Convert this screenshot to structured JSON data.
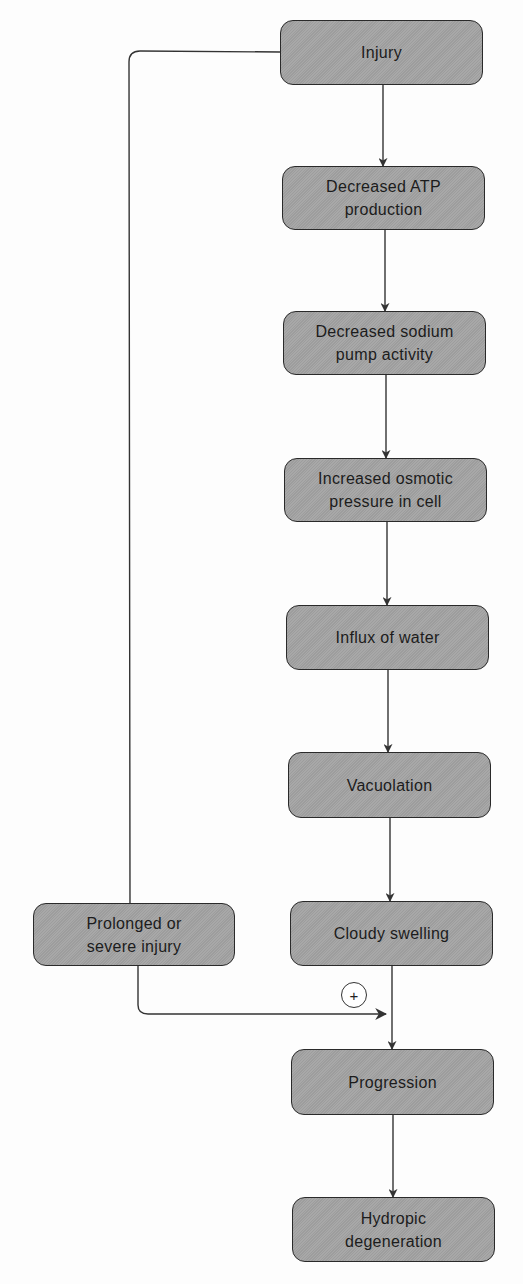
{
  "diagram": {
    "type": "flowchart",
    "colors": {
      "node_fill": "#a3a3a3",
      "node_border": "#2a2a2a",
      "text": "#1c1c1c",
      "connector": "#333333",
      "background": "#fdfdfd"
    },
    "nodes": [
      {
        "id": "injury",
        "label": "Injury"
      },
      {
        "id": "decreased-atp",
        "label": "Decreased ATP production"
      },
      {
        "id": "decreased-sodium-pump",
        "label": "Decreased sodium pump activity"
      },
      {
        "id": "increased-osmotic-pressure",
        "label": "Increased osmotic pressure in cell"
      },
      {
        "id": "influx-of-water",
        "label": "Influx of water"
      },
      {
        "id": "vacuolation",
        "label": "Vacuolation"
      },
      {
        "id": "cloudy-swelling",
        "label": "Cloudy swelling"
      },
      {
        "id": "prolonged-severe-injury",
        "label": "Prolonged or severe injury"
      },
      {
        "id": "progression",
        "label": "Progression"
      },
      {
        "id": "hydropic-degeneration",
        "label": "Hydropic degeneration"
      }
    ],
    "edges": [
      {
        "from": "injury",
        "to": "decreased-atp"
      },
      {
        "from": "decreased-atp",
        "to": "decreased-sodium-pump"
      },
      {
        "from": "decreased-sodium-pump",
        "to": "increased-osmotic-pressure"
      },
      {
        "from": "increased-osmotic-pressure",
        "to": "influx-of-water"
      },
      {
        "from": "influx-of-water",
        "to": "vacuolation"
      },
      {
        "from": "vacuolation",
        "to": "cloudy-swelling"
      },
      {
        "from": "cloudy-swelling",
        "to": "progression"
      },
      {
        "from": "injury",
        "to": "prolonged-severe-injury",
        "style": "line"
      },
      {
        "from": "prolonged-severe-injury",
        "to": "progression",
        "label": "+"
      },
      {
        "from": "progression",
        "to": "hydropic-degeneration"
      }
    ],
    "plus_symbol": "+"
  }
}
